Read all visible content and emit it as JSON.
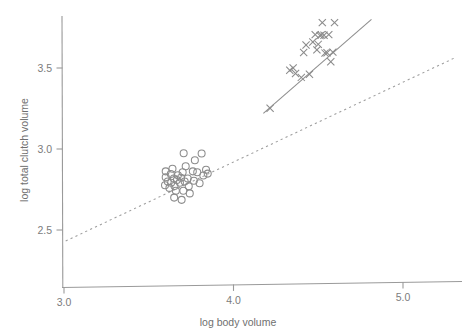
{
  "chart_data": {
    "type": "scatter",
    "title": "",
    "xlabel": "log body volume",
    "ylabel": "log total clutch volume",
    "xlim": [
      2.92,
      5.3
    ],
    "ylim": [
      2.28,
      3.88
    ],
    "xticks": [
      3.0,
      4.0,
      5.0
    ],
    "xticklabels": [
      "3.0",
      "4.0",
      "5.0"
    ],
    "yticks": [
      2.5,
      3.0,
      3.5
    ],
    "yticklabels": [
      "2.5",
      "3.0",
      "3.5"
    ],
    "grid": false,
    "legend": "none",
    "series": [
      {
        "name": "open-circles",
        "marker": "circle",
        "color": "#8c8c8c",
        "points": [
          [
            3.6,
            2.826
          ],
          [
            3.612,
            2.8
          ],
          [
            3.596,
            2.776
          ],
          [
            3.63,
            2.846
          ],
          [
            3.648,
            2.818
          ],
          [
            3.632,
            2.792
          ],
          [
            3.622,
            2.76
          ],
          [
            3.652,
            2.772
          ],
          [
            3.666,
            2.808
          ],
          [
            3.672,
            2.838
          ],
          [
            3.66,
            2.742
          ],
          [
            3.684,
            2.792
          ],
          [
            3.69,
            2.822
          ],
          [
            3.7,
            2.856
          ],
          [
            3.704,
            2.742
          ],
          [
            3.712,
            2.8
          ],
          [
            3.718,
            2.894
          ],
          [
            3.706,
            2.974
          ],
          [
            3.73,
            2.818
          ],
          [
            3.736,
            2.77
          ],
          [
            3.742,
            2.726
          ],
          [
            3.65,
            2.7
          ],
          [
            3.694,
            2.686
          ],
          [
            3.76,
            2.862
          ],
          [
            3.766,
            2.804
          ],
          [
            3.772,
            2.93
          ],
          [
            3.786,
            2.856
          ],
          [
            3.8,
            2.788
          ],
          [
            3.812,
            2.972
          ],
          [
            3.822,
            2.836
          ],
          [
            3.838,
            2.872
          ],
          [
            3.848,
            2.848
          ],
          [
            3.6,
            2.862
          ],
          [
            3.64,
            2.878
          ]
        ]
      },
      {
        "name": "crosses",
        "marker": "x",
        "color": "#8a8a8a",
        "points": [
          [
            4.216,
            3.252
          ],
          [
            4.332,
            3.486
          ],
          [
            4.352,
            3.5
          ],
          [
            4.366,
            3.466
          ],
          [
            4.4,
            3.442
          ],
          [
            4.414,
            3.596
          ],
          [
            4.428,
            3.642
          ],
          [
            4.448,
            3.462
          ],
          [
            4.468,
            3.66
          ],
          [
            4.482,
            3.706
          ],
          [
            4.492,
            3.612
          ],
          [
            4.5,
            3.646
          ],
          [
            4.51,
            3.7
          ],
          [
            4.518,
            3.704
          ],
          [
            4.524,
            3.78
          ],
          [
            4.534,
            3.702
          ],
          [
            4.54,
            3.592
          ],
          [
            4.552,
            3.594
          ],
          [
            4.562,
            3.706
          ],
          [
            4.574,
            3.538
          ],
          [
            4.586,
            3.598
          ],
          [
            4.596,
            3.78
          ]
        ]
      }
    ],
    "fit_lines": [
      {
        "name": "solid-regression-line",
        "style": "solid",
        "color": "#8e8e8e",
        "x": [
          4.176,
          4.814
        ],
        "y": [
          3.22,
          3.8
        ]
      },
      {
        "name": "dashed-reference-line",
        "style": "dashed",
        "color": "#9d9d9d",
        "x": [
          3.01,
          5.3
        ],
        "y": [
          2.432,
          3.56
        ]
      }
    ]
  },
  "axes": {
    "x_axis_name": "x-axis",
    "y_axis_name": "y-axis"
  }
}
